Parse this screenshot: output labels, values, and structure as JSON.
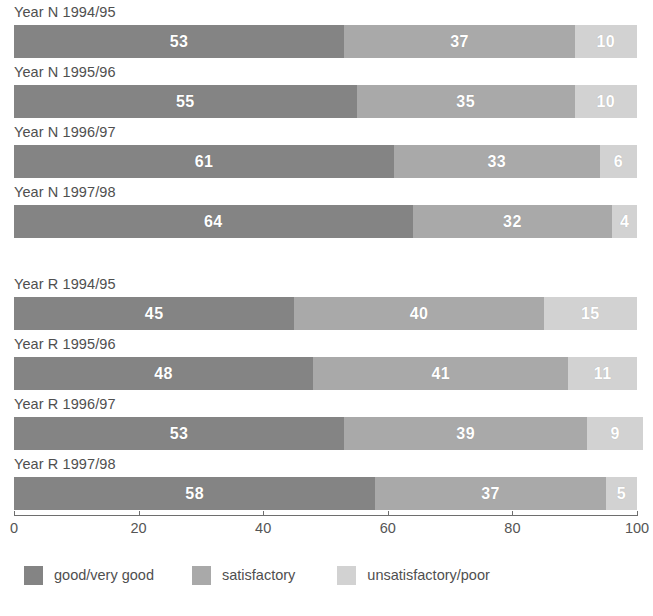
{
  "chart_data": {
    "type": "bar",
    "orientation": "horizontal",
    "stacked": true,
    "title": "",
    "subtitle": "",
    "xlabel": "",
    "ylabel": "",
    "xlim": [
      0,
      100
    ],
    "xticks": [
      0,
      20,
      40,
      60,
      80,
      100
    ],
    "xtick_labels": [
      "0",
      "20",
      "40",
      "60",
      "80",
      "100"
    ],
    "grid": false,
    "legend_position": "bottom-left",
    "categories": [
      "Year N 1994/95",
      "Year N 1995/96",
      "Year N 1996/97",
      "Year N 1997/98",
      "Year R 1994/95",
      "Year R 1995/96",
      "Year R 1996/97",
      "Year R 1997/98"
    ],
    "series": [
      {
        "name": "good/very good",
        "color": "#848484",
        "values": [
          53,
          55,
          61,
          64,
          45,
          48,
          53,
          58
        ]
      },
      {
        "name": "satisfactory",
        "color": "#a9a9a9",
        "values": [
          37,
          35,
          33,
          32,
          40,
          41,
          39,
          37
        ]
      },
      {
        "name": "unsatisfactory/poor",
        "color": "#d2d2d2",
        "values": [
          10,
          10,
          6,
          4,
          15,
          11,
          9,
          5
        ]
      }
    ]
  },
  "groups": [
    {
      "name": "year-n",
      "rows": [
        {
          "label": "Year N 1994/95",
          "good": 53,
          "satis": 37,
          "unsatis": 10
        },
        {
          "label": "Year N 1995/96",
          "good": 55,
          "satis": 35,
          "unsatis": 10
        },
        {
          "label": "Year N 1996/97",
          "good": 61,
          "satis": 33,
          "unsatis": 6
        },
        {
          "label": "Year N 1997/98",
          "good": 64,
          "satis": 32,
          "unsatis": 4
        }
      ]
    },
    {
      "name": "year-r",
      "rows": [
        {
          "label": "Year R 1994/95",
          "good": 45,
          "satis": 40,
          "unsatis": 15
        },
        {
          "label": "Year R 1995/96",
          "good": 48,
          "satis": 41,
          "unsatis": 11
        },
        {
          "label": "Year R 1996/97",
          "good": 53,
          "satis": 39,
          "unsatis": 9
        },
        {
          "label": "Year R 1997/98",
          "good": 58,
          "satis": 37,
          "unsatis": 5
        }
      ]
    }
  ],
  "axis": {
    "ticks": [
      "0",
      "20",
      "40",
      "60",
      "80",
      "100"
    ],
    "values": [
      0,
      20,
      40,
      60,
      80,
      100
    ]
  },
  "legend": {
    "items": [
      {
        "label": "good/very good",
        "color": "#848484",
        "key": "good"
      },
      {
        "label": "satisfactory",
        "color": "#a9a9a9",
        "key": "satis"
      },
      {
        "label": "unsatisfactory/poor",
        "color": "#d2d2d2",
        "key": "unsatis"
      }
    ]
  }
}
